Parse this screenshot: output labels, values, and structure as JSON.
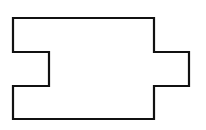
{
  "diagram": {
    "type": "outline-shape",
    "stroke_color": "#111111",
    "fill_color": "#ffffff",
    "background": "#ffffff",
    "stroke_width": 2.2,
    "points": [
      [
        13,
        18
      ],
      [
        154,
        18
      ],
      [
        154,
        52
      ],
      [
        189,
        52
      ],
      [
        189,
        86
      ],
      [
        154,
        86
      ],
      [
        154,
        119
      ],
      [
        13,
        119
      ],
      [
        13,
        86
      ],
      [
        49,
        86
      ],
      [
        49,
        52
      ],
      [
        13,
        52
      ]
    ]
  }
}
